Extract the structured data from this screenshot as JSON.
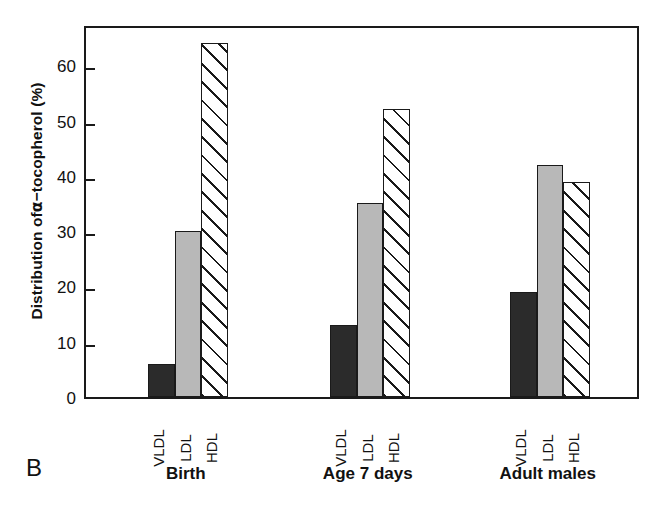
{
  "panel_label": "B",
  "chart_data": {
    "type": "bar",
    "title": "",
    "xlabel": "",
    "ylabel": "Distribution of α−tocopherol (%)",
    "ylabel_prefix": "Distribution of ",
    "ylabel_alpha": "α",
    "ylabel_suffix": "−tocopherol (%)",
    "ylim": [
      0,
      67
    ],
    "yticks": [
      0,
      10,
      20,
      30,
      40,
      50,
      60
    ],
    "ytick_labels": [
      "0",
      "10",
      "20",
      "30",
      "40",
      "50",
      "60"
    ],
    "grid": false,
    "legend": "none",
    "categories": [
      "Birth",
      "Age 7 days",
      "Adult males"
    ],
    "series": [
      {
        "name": "VLDL",
        "values": [
          6,
          13,
          19
        ],
        "fill": "solid-dark",
        "color": "#2b2b2b"
      },
      {
        "name": "LDL",
        "values": [
          30,
          35,
          42
        ],
        "fill": "solid-gray",
        "color": "#b8b8b8"
      },
      {
        "name": "HDL",
        "values": [
          64,
          52,
          38.8
        ],
        "fill": "diagonal-hatch",
        "color": "#ffffff"
      }
    ],
    "groups": [
      {
        "label": "Birth",
        "bars": [
          {
            "series": "VLDL",
            "value": 6
          },
          {
            "series": "LDL",
            "value": 30
          },
          {
            "series": "HDL",
            "value": 64
          }
        ]
      },
      {
        "label": "Age 7 days",
        "bars": [
          {
            "series": "VLDL",
            "value": 13
          },
          {
            "series": "LDL",
            "value": 35
          },
          {
            "series": "HDL",
            "value": 52
          }
        ]
      },
      {
        "label": "Adult males",
        "bars": [
          {
            "series": "VLDL",
            "value": 19
          },
          {
            "series": "LDL",
            "value": 42
          },
          {
            "series": "HDL",
            "value": 38.8
          }
        ]
      }
    ],
    "axis_color": "#1a1a1a"
  }
}
